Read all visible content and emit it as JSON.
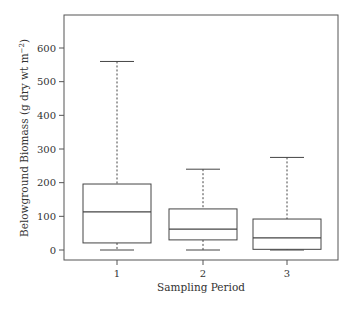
{
  "chart_data": {
    "type": "box",
    "title": "",
    "xlabel": "Sampling Period",
    "ylabel": "Belowground Biomass (g dry wt m",
    "ylabel_sup": "−2",
    "ylabel_close": ")",
    "ylim": [
      0,
      690
    ],
    "yticks": [
      0,
      100,
      200,
      300,
      400,
      500,
      600
    ],
    "categories": [
      "1",
      "2",
      "3"
    ],
    "grid": false,
    "legend": null,
    "boxes": [
      {
        "label": "1",
        "min": 0,
        "q1": 21,
        "median": 113,
        "q3": 196,
        "max": 560
      },
      {
        "label": "2",
        "min": 0,
        "q1": 30,
        "median": 62,
        "q3": 122,
        "max": 240
      },
      {
        "label": "3",
        "min": 0,
        "q1": 2,
        "median": 36,
        "q3": 92,
        "max": 275
      }
    ]
  },
  "colors": {
    "axis": "#555555",
    "box_stroke": "#444444",
    "background": "#ffffff"
  }
}
